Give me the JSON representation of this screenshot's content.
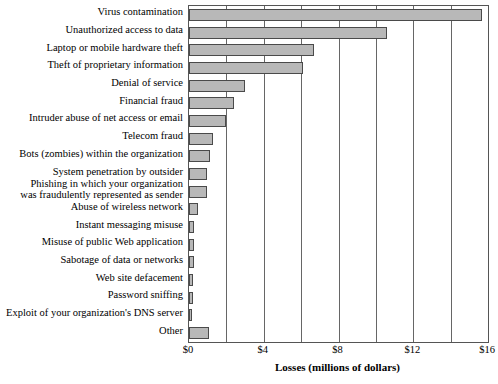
{
  "chart_data": {
    "type": "bar",
    "orientation": "horizontal",
    "title": "",
    "xlabel": "Losses (millions of dollars)",
    "ylabel": "",
    "xlim": [
      0,
      16
    ],
    "xticks": [
      0,
      4,
      8,
      12,
      16
    ],
    "xticklabels": [
      "$0",
      "$4",
      "$8",
      "$12",
      "$16"
    ],
    "gridlines_every": 2,
    "grid": true,
    "legend": "none",
    "bar_fill_color": "#b8b8b8",
    "bar_edge_color": "#4a4a4a",
    "axis_color": "#555555",
    "categories": [
      "Virus contamination",
      "Unauthorized access to data",
      "Laptop or mobile hardware theft",
      "Theft of proprietary information",
      "Denial of service",
      "Financial fraud",
      "Intruder abuse of net access or email",
      "Telecom fraud",
      "Bots (zombies) within the organization",
      "System penetration by outsider",
      "Phishing in which your organization\nwas fraudulently represented as sender",
      "Abuse of wireless network",
      "Instant messaging misuse",
      "Misuse of public Web application",
      "Sabotage of data or networks",
      "Web site defacement",
      "Password sniffing",
      "Exploit of your organization's DNS server",
      "Other"
    ],
    "values": [
      15.7,
      10.6,
      6.7,
      6.1,
      3.0,
      2.4,
      2.0,
      1.3,
      1.1,
      0.95,
      0.95,
      0.5,
      0.28,
      0.28,
      0.25,
      0.22,
      0.22,
      0.12,
      1.05
    ]
  }
}
